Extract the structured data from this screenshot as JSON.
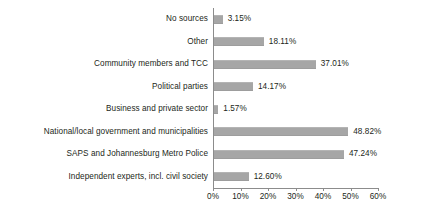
{
  "chart_data": {
    "type": "bar",
    "orientation": "horizontal",
    "title": "",
    "subtitle": "",
    "xlabel": "",
    "ylabel": "",
    "xlim": [
      0,
      60
    ],
    "xticks": [
      "0%",
      "10%",
      "20%",
      "30%",
      "40%",
      "50%",
      "60%"
    ],
    "xtick_values": [
      0,
      10,
      20,
      30,
      40,
      50,
      60
    ],
    "grid": false,
    "legend": null,
    "bar_color": "#a6a6a6",
    "axis_color": "#8c8c8c",
    "text_color": "#231f20",
    "categories": [
      "No sources",
      "Other",
      "Community members and TCC",
      "Political parties",
      "Business and private sector",
      "National/local government and municipalities",
      "SAPS and Johannesburg Metro Police",
      "Independent experts, incl. civil society"
    ],
    "values": [
      3.15,
      18.11,
      37.01,
      14.17,
      1.57,
      48.82,
      47.24,
      12.6
    ],
    "value_labels": [
      "3.15%",
      "18.11%",
      "37.01%",
      "14.17%",
      "1.57%",
      "48.82%",
      "47.24%",
      "12.60%"
    ]
  }
}
